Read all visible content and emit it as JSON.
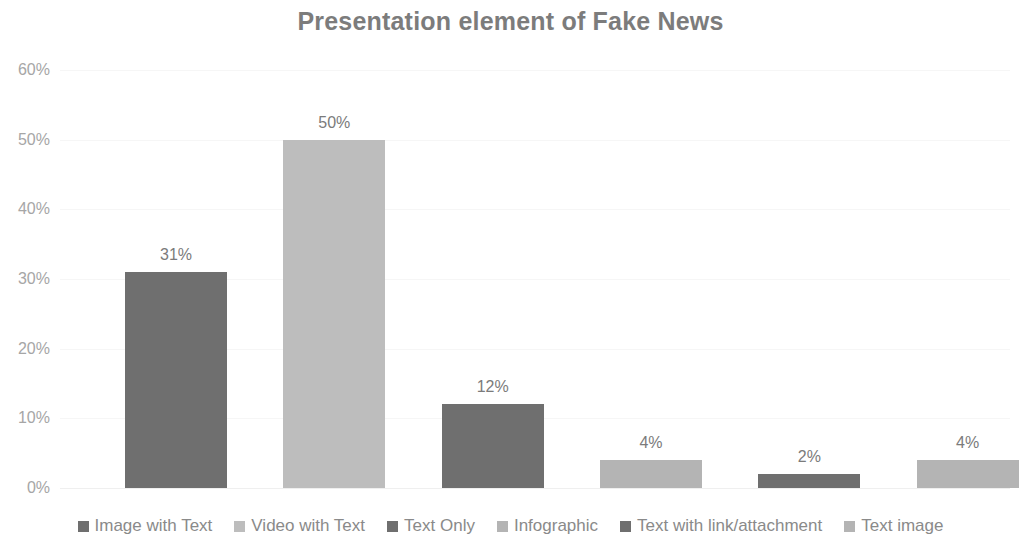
{
  "chart_data": {
    "type": "bar",
    "title": "Presentation element of Fake News",
    "xlabel": "",
    "ylabel": "",
    "categories": [
      "Image with Text",
      "Video with Text",
      "Text Only",
      "Infographic",
      "Text with link/attachment",
      "Text image"
    ],
    "values": [
      31,
      50,
      12,
      4,
      2,
      4
    ],
    "data_labels": [
      "31%",
      "50%",
      "12%",
      "4%",
      "2%",
      "4%"
    ],
    "ylim": [
      0,
      60
    ],
    "yticks": [
      0,
      10,
      20,
      30,
      40,
      50,
      60
    ],
    "ytick_labels": [
      "0%",
      "10%",
      "20%",
      "30%",
      "40%",
      "50%",
      "60%"
    ],
    "grid": true,
    "legend_position": "bottom",
    "series_colors": [
      "#6f6f6f",
      "#bdbdbd",
      "#6f6f6f",
      "#b4b4b4",
      "#6f6f6f",
      "#b4b4b4"
    ],
    "bar_colors": [
      "#6f6f6f",
      "#bdbdbd",
      "#6f6f6f",
      "#b4b4b4",
      "#6f6f6f",
      "#b4b4b4"
    ]
  },
  "style": {
    "title_color": "#7c7c7c",
    "tick_color": "#a6a6a6",
    "label_color": "#7b7b7b",
    "legend_color": "#8a8a8a",
    "grid_color": "#f6f6f6",
    "background": "#ffffff"
  },
  "yticks": [
    {
      "label": "60%",
      "value": 60
    },
    {
      "label": "50%",
      "value": 50
    },
    {
      "label": "40%",
      "value": 40
    },
    {
      "label": "30%",
      "value": 30
    },
    {
      "label": "20%",
      "value": 20
    },
    {
      "label": "10%",
      "value": 10
    },
    {
      "label": "0%",
      "value": 0
    }
  ],
  "bars": [
    {
      "label": "Image with Text",
      "value": 31,
      "data_label": "31%",
      "color": "#6f6f6f"
    },
    {
      "label": "Video with Text",
      "value": 50,
      "data_label": "50%",
      "color": "#bdbdbd"
    },
    {
      "label": "Text Only",
      "value": 12,
      "data_label": "12%",
      "color": "#6f6f6f"
    },
    {
      "label": "Infographic",
      "value": 4,
      "data_label": "4%",
      "color": "#b4b4b4"
    },
    {
      "label": "Text with link/attachment",
      "value": 2,
      "data_label": "2%",
      "color": "#6f6f6f"
    },
    {
      "label": "Text image",
      "value": 4,
      "data_label": "4%",
      "color": "#b4b4b4"
    }
  ],
  "legend": [
    {
      "label": "Image with Text",
      "color": "#6f6f6f"
    },
    {
      "label": "Video with Text",
      "color": "#bdbdbd"
    },
    {
      "label": "Text Only",
      "color": "#6f6f6f"
    },
    {
      "label": "Infographic",
      "color": "#b4b4b4"
    },
    {
      "label": "Text with link/attachment",
      "color": "#6f6f6f"
    },
    {
      "label": "Text image",
      "color": "#b4b4b4"
    }
  ]
}
